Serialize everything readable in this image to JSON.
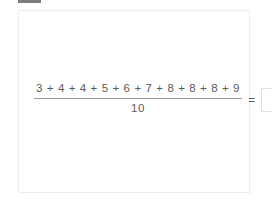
{
  "window": {
    "background_color": "#ffffff",
    "top_nub_color": "#7c7c7c"
  },
  "card": {
    "border_color": "#ededed",
    "background_color": "#ffffff"
  },
  "problem": {
    "type": "mean-average-fraction",
    "numerator_text": "3 + 4 + 4 + 5 + 6 + 7 + 8 + 8 + 8 + 9",
    "denominator_text": "10",
    "equals_text": "=",
    "answer_value": "",
    "answer_placeholder": "",
    "text_color": "#5a5a5a",
    "rule_color": "#9a9a9a"
  },
  "chart_data": {
    "type": "table",
    "categories": [
      "term 1",
      "term 2",
      "term 3",
      "term 4",
      "term 5",
      "term 6",
      "term 7",
      "term 8",
      "term 9",
      "term 10"
    ],
    "values": [
      3,
      4,
      4,
      5,
      6,
      7,
      8,
      8,
      8,
      9
    ],
    "divisor": 10,
    "xlabel": "",
    "ylabel": ""
  }
}
